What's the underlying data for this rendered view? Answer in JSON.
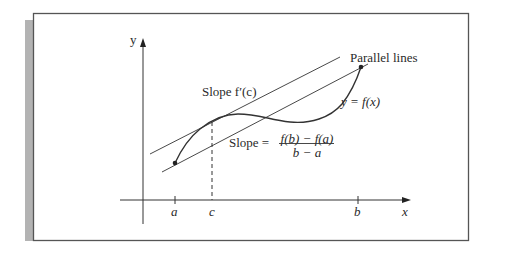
{
  "figure": {
    "labels": {
      "y_axis": "y",
      "x_axis": "x",
      "tick_a": "a",
      "tick_c": "c",
      "tick_b": "b",
      "parallel_lines": "Parallel lines",
      "function": "y = f(x)",
      "tangent_slope": "Slope f′(c)",
      "secant_slope_prefix": "Slope =",
      "secant_numerator": "f(b) − f(a)",
      "secant_denominator": "b − a"
    },
    "colors": {
      "stroke": "#333333",
      "frame": "#555555",
      "shadow": "#b0b0b0",
      "background": "#ffffff"
    }
  }
}
